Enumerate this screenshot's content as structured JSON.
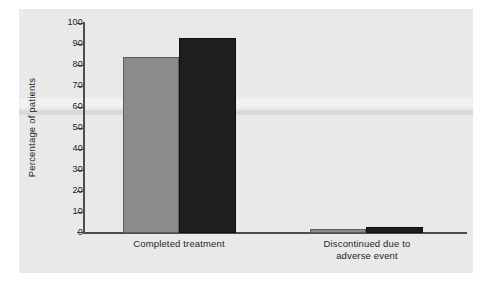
{
  "chart_data": {
    "type": "bar",
    "title": "",
    "subtitle": "",
    "xlabel": "",
    "ylabel": "Percentage of patients",
    "ylim": [
      0,
      100
    ],
    "ytick_step": 10,
    "yticks": [
      100,
      90,
      80,
      70,
      60,
      50,
      40,
      30,
      20,
      10,
      0
    ],
    "ytick_labels": [
      "100",
      "90",
      "80",
      "70",
      "60",
      "50",
      "40",
      "30",
      "20",
      "10",
      "0"
    ],
    "grid": false,
    "legend": "none",
    "categories": [
      "Completed treatment",
      "Discontinued due to adverse event"
    ],
    "category_label_lines": [
      [
        "Completed treatment"
      ],
      [
        "Discontinued due to",
        "adverse event"
      ]
    ],
    "series": [
      {
        "name": "Group 1",
        "color": "#8b8b8b",
        "edge_color": "#5d5d5d",
        "values": [
          84,
          2
        ]
      },
      {
        "name": "Group 2",
        "color": "#1e1e1e",
        "edge_color": "#101010",
        "values": [
          93,
          3
        ]
      }
    ],
    "axis_color": "#4d4d4d",
    "panel_color": "#e9e9e9",
    "page_color": "#ffffff"
  }
}
